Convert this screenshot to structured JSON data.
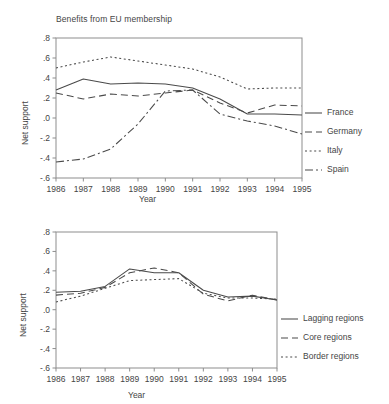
{
  "figure": {
    "background": "#ffffff",
    "line_color": "#4a4a4a",
    "axis_color": "#8d8d8d",
    "text_color": "#454545"
  },
  "chart_data": [
    {
      "id": "top",
      "type": "line",
      "title": "Benefits from EU membership",
      "xlabel": "Year",
      "ylabel": "Net support",
      "grid": false,
      "legend_position": "right",
      "x": [
        1986,
        1987,
        1988,
        1989,
        1990,
        1991,
        1992,
        1993,
        1994,
        1995
      ],
      "xtick_labels": [
        "1986",
        "1987",
        "1988",
        "1989",
        "1990",
        "1991",
        "1992",
        "1993",
        "1994",
        "1995"
      ],
      "xlim": [
        1986,
        1995
      ],
      "ylim": [
        -0.6,
        0.8
      ],
      "ytick_values": [
        0.8,
        0.6,
        0.4,
        0.2,
        0.0,
        -0.2,
        -0.4,
        -0.6
      ],
      "ytick_labels": [
        ".8",
        ".6",
        ".4",
        ".2",
        ".0",
        "-.2",
        "-.4",
        "-.6"
      ],
      "series": [
        {
          "name": "France",
          "dash_style": "solid",
          "dash_pattern": "none",
          "values": [
            0.28,
            0.39,
            0.34,
            0.35,
            0.34,
            0.3,
            0.19,
            0.04,
            0.04,
            0.03
          ]
        },
        {
          "name": "Germany",
          "dash_style": "dashed",
          "dash_pattern": "7,4",
          "values": [
            0.25,
            0.19,
            0.24,
            0.22,
            0.25,
            0.28,
            0.15,
            0.05,
            0.13,
            0.12
          ]
        },
        {
          "name": "Italy",
          "dash_style": "dotted",
          "dash_pattern": "2,2.6",
          "values": [
            0.5,
            0.56,
            0.61,
            0.57,
            0.53,
            0.49,
            0.41,
            0.29,
            0.3,
            0.3
          ]
        },
        {
          "name": "Spain",
          "dash_style": "dashdot",
          "dash_pattern": "8,3,2,3",
          "values": [
            -0.44,
            -0.41,
            -0.31,
            -0.06,
            0.27,
            0.28,
            0.04,
            -0.03,
            -0.08,
            -0.16
          ]
        }
      ]
    },
    {
      "id": "bottom",
      "type": "line",
      "title": "",
      "xlabel": "Year",
      "ylabel": "Net support",
      "grid": false,
      "legend_position": "right",
      "x": [
        1986,
        1987,
        1988,
        1989,
        1990,
        1991,
        1992,
        1993,
        1994,
        1995
      ],
      "xtick_labels": [
        "1986",
        "1987",
        "1988",
        "1989",
        "1990",
        "1991",
        "1992",
        "1993",
        "1994",
        "1995"
      ],
      "xlim": [
        1986,
        1995
      ],
      "ylim": [
        -0.6,
        0.8
      ],
      "ytick_values": [
        0.8,
        0.6,
        0.4,
        0.2,
        0.0,
        -0.2,
        -0.4,
        -0.6
      ],
      "ytick_labels": [
        ".8",
        ".6",
        ".4",
        ".2",
        ".0",
        "-.2",
        "-.4",
        "-.6"
      ],
      "series": [
        {
          "name": "Lagging regions",
          "dash_style": "solid",
          "dash_pattern": "none",
          "values": [
            0.18,
            0.19,
            0.24,
            0.42,
            0.38,
            0.38,
            0.2,
            0.13,
            0.14,
            0.1
          ]
        },
        {
          "name": "Core regions",
          "dash_style": "dashed",
          "dash_pattern": "7,4",
          "values": [
            0.15,
            0.17,
            0.23,
            0.38,
            0.43,
            0.38,
            0.16,
            0.09,
            0.15,
            0.1
          ]
        },
        {
          "name": "Border regions",
          "dash_style": "dotted",
          "dash_pattern": "2,2.6",
          "values": [
            0.08,
            0.14,
            0.22,
            0.3,
            0.31,
            0.32,
            0.17,
            0.12,
            0.12,
            0.11
          ]
        }
      ]
    }
  ]
}
